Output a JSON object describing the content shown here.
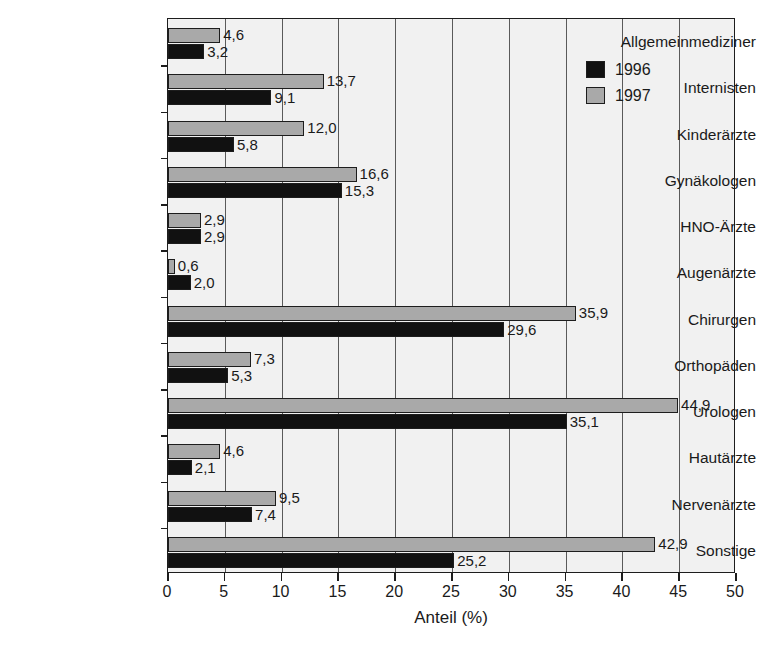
{
  "chart_data": {
    "type": "bar",
    "orientation": "horizontal",
    "title": "",
    "xlabel": "Anteil (%)",
    "ylabel": "",
    "xlim": [
      0,
      50
    ],
    "xticks": [
      0,
      5,
      10,
      15,
      20,
      25,
      30,
      35,
      40,
      45,
      50
    ],
    "grid": "vertical",
    "legend_position": "top-right",
    "categories": [
      "Allgemeinmediziner",
      "Internisten",
      "Kinderärzte",
      "Gynäkologen",
      "HNO-Ärzte",
      "Augenärzte",
      "Chirurgen",
      "Orthopäden",
      "Urologen",
      "Hautärzte",
      "Nervenärzte",
      "Sonstige"
    ],
    "series": [
      {
        "name": "1996",
        "color": "#111111",
        "values": [
          3.2,
          9.1,
          5.8,
          15.3,
          2.9,
          2.0,
          29.6,
          5.3,
          35.1,
          2.1,
          7.4,
          25.2
        ],
        "labels": [
          "3,2",
          "9,1",
          "5,8",
          "15,3",
          "2,9",
          "2,0",
          "29,6",
          "5,3",
          "35,1",
          "2,1",
          "7,4",
          "25,2"
        ]
      },
      {
        "name": "1997",
        "color": "#a9a9a9",
        "values": [
          4.6,
          13.7,
          12.0,
          16.6,
          2.9,
          0.6,
          35.9,
          7.3,
          44.9,
          4.6,
          9.5,
          42.9
        ],
        "labels": [
          "4,6",
          "13,7",
          "12,0",
          "16,6",
          "2,9",
          "0,6",
          "35,9",
          "7,3",
          "44,9",
          "4,6",
          "9,5",
          "42,9"
        ]
      }
    ],
    "xtick_labels": [
      "0",
      "5",
      "10",
      "15",
      "20",
      "25",
      "30",
      "35",
      "40",
      "45",
      "50"
    ]
  },
  "legend": {
    "entries": [
      {
        "label": "1996",
        "swatch": "black-square"
      },
      {
        "label": "1997",
        "swatch": "gray-square"
      }
    ]
  },
  "colors": {
    "series_1996": "#111111",
    "series_1997": "#a9a9a9",
    "plot_background": "#f1f1f1",
    "axis": "#1d1d1d",
    "gridline": "#5a5a5a"
  }
}
